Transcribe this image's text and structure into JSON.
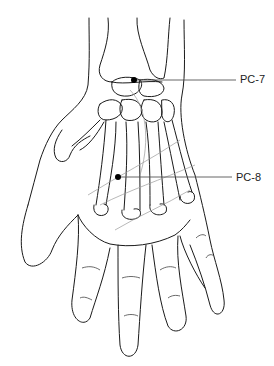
{
  "diagram": {
    "points": [
      {
        "id": "PC-7",
        "label": "PC-7",
        "x": 134,
        "y": 80,
        "label_x": 240,
        "label_y": 74
      },
      {
        "id": "PC-8",
        "label": "PC-8",
        "x": 118,
        "y": 177,
        "label_x": 236,
        "label_y": 172
      }
    ],
    "colors": {
      "outline": "#1a1a1a",
      "bone": "#333333",
      "leader": "#555555",
      "crease": "#999999",
      "point": "#000000"
    }
  }
}
